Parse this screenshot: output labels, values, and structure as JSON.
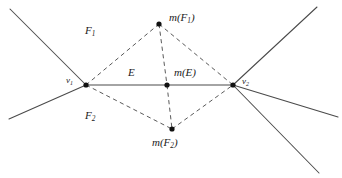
{
  "figure": {
    "width": 342,
    "height": 178,
    "background": "#ffffff",
    "stroke_color": "#4a4a4a",
    "dash_color": "#5a5a5a",
    "dot_color": "#111111",
    "text_color": "#1b1b1b"
  },
  "labels": {
    "v1": {
      "base": "v",
      "sub": "1"
    },
    "v2": {
      "base": "v",
      "sub": "2"
    },
    "F1": {
      "base": "F",
      "sub": "1"
    },
    "F2": {
      "base": "F",
      "sub": "2"
    },
    "E": {
      "text": "E"
    },
    "mE": {
      "text": "m(E)"
    },
    "mF1": {
      "pre": "m(F",
      "sub": "1",
      "post": ")"
    },
    "mF2": {
      "pre": "m(F",
      "sub": "2",
      "post": ")"
    }
  },
  "points": {
    "v1": {
      "x": 86,
      "y": 85,
      "label": "v1"
    },
    "v2": {
      "x": 233,
      "y": 85,
      "label": "v2"
    },
    "mF1": {
      "x": 159,
      "y": 24,
      "label": "mF1"
    },
    "mF2": {
      "x": 172,
      "y": 129,
      "label": "mF2"
    },
    "mE": {
      "x": 167,
      "y": 85,
      "label": "mE"
    }
  },
  "edges": {
    "solid": [
      {
        "name": "ray-upper-left",
        "x1": 10,
        "y1": 9,
        "x2": 86,
        "y2": 85
      },
      {
        "name": "ray-lower-left",
        "x1": 86,
        "y1": 85,
        "x2": 9,
        "y2": 119
      },
      {
        "name": "edge-E",
        "x1": 86,
        "y1": 85,
        "x2": 233,
        "y2": 85
      },
      {
        "name": "ray-upper-right",
        "x1": 233,
        "y1": 85,
        "x2": 317,
        "y2": 7
      },
      {
        "name": "ray-right-shallow",
        "x1": 233,
        "y1": 85,
        "x2": 338,
        "y2": 117
      },
      {
        "name": "ray-lower-right",
        "x1": 233,
        "y1": 85,
        "x2": 319,
        "y2": 173
      }
    ],
    "dashed": [
      {
        "name": "v1-to-mF1",
        "x1": 86,
        "y1": 85,
        "x2": 159,
        "y2": 24
      },
      {
        "name": "mF1-to-v2",
        "x1": 159,
        "y1": 24,
        "x2": 233,
        "y2": 85
      },
      {
        "name": "v1-to-mF2",
        "x1": 86,
        "y1": 85,
        "x2": 172,
        "y2": 129
      },
      {
        "name": "mF2-to-v2",
        "x1": 172,
        "y1": 129,
        "x2": 233,
        "y2": 85
      },
      {
        "name": "mF1-to-mE",
        "x1": 159,
        "y1": 24,
        "x2": 167,
        "y2": 85
      },
      {
        "name": "mE-to-mF2",
        "x1": 167,
        "y1": 85,
        "x2": 172,
        "y2": 129
      }
    ]
  },
  "label_positions": {
    "v1": {
      "x": 66,
      "y": 76
    },
    "v2": {
      "x": 242,
      "y": 77
    },
    "F1": {
      "x": 85,
      "y": 25
    },
    "F2": {
      "x": 85,
      "y": 110
    },
    "E": {
      "x": 128,
      "y": 67
    },
    "mE": {
      "x": 174,
      "y": 67
    },
    "mF1": {
      "x": 169,
      "y": 12
    },
    "mF2": {
      "x": 152,
      "y": 137
    }
  }
}
